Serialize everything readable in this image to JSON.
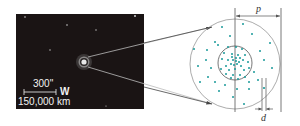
{
  "figure": {
    "photo": {
      "background_color": "#1a1414",
      "scale_bar": {
        "angle_label": "300\"",
        "distance_label": "150,000 km",
        "direction_label": "W"
      }
    },
    "schematic": {
      "outer_radius_label": "p",
      "width_label": "d",
      "dot_color": "#1a9a9a",
      "line_color": "#555555"
    }
  }
}
